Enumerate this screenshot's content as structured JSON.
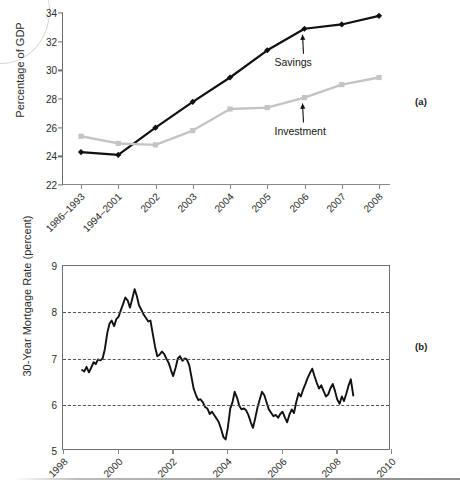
{
  "figure": {
    "panel_a_tag": "(a)",
    "panel_b_tag": "(b)"
  },
  "chart_data": [
    {
      "id": "panel-a",
      "type": "line",
      "title": "",
      "xlabel": "",
      "ylabel": "Percentage of GDP",
      "ylim": [
        22,
        34
      ],
      "yticks": [
        22,
        24,
        26,
        28,
        30,
        32,
        34
      ],
      "grid": false,
      "legend": "annotations",
      "categories": [
        "1986–1993",
        "1994–2001",
        "2002",
        "2003",
        "2004",
        "2005",
        "2006",
        "2007",
        "2008"
      ],
      "annotations": [
        {
          "text": "Savings",
          "points_to": "2006"
        },
        {
          "text": "Investment",
          "points_to": "2006"
        }
      ],
      "series": [
        {
          "name": "Savings",
          "color": "#111111",
          "marker": "diamond",
          "values": [
            24.3,
            24.1,
            26.0,
            27.8,
            29.5,
            31.4,
            32.9,
            33.2,
            33.8
          ]
        },
        {
          "name": "Investment",
          "color": "#c4c4c4",
          "marker": "square",
          "values": [
            25.4,
            24.9,
            24.8,
            25.8,
            27.3,
            27.4,
            28.1,
            29.0,
            29.5
          ]
        }
      ]
    },
    {
      "id": "panel-b",
      "type": "line",
      "title": "",
      "xlabel": "",
      "ylabel": "30-Year Mortgage Rate (percent)",
      "ylim": [
        5,
        9
      ],
      "yticks": [
        5,
        6,
        7,
        8,
        9
      ],
      "xlim": [
        1998,
        2010
      ],
      "xticks": [
        1998,
        2000,
        2002,
        2004,
        2006,
        2008,
        2010
      ],
      "grid": true,
      "gridlines_at": [
        6,
        7,
        8
      ],
      "series": [
        {
          "name": "30-Year Mortgage Rate",
          "color": "#111111",
          "x": [
            1998.7,
            1998.78,
            1998.86,
            1998.95,
            1999.03,
            1999.12,
            1999.2,
            1999.28,
            1999.37,
            1999.45,
            1999.53,
            1999.62,
            1999.7,
            1999.78,
            1999.87,
            1999.95,
            2000.03,
            2000.12,
            2000.2,
            2000.28,
            2000.37,
            2000.45,
            2000.53,
            2000.62,
            2000.7,
            2000.78,
            2000.87,
            2000.95,
            2001.03,
            2001.12,
            2001.2,
            2001.28,
            2001.37,
            2001.45,
            2001.53,
            2001.62,
            2001.7,
            2001.78,
            2001.87,
            2001.95,
            2002.03,
            2002.12,
            2002.2,
            2002.28,
            2002.37,
            2002.45,
            2002.53,
            2002.62,
            2002.7,
            2002.78,
            2002.87,
            2002.95,
            2003.03,
            2003.12,
            2003.2,
            2003.28,
            2003.37,
            2003.45,
            2003.53,
            2003.62,
            2003.7,
            2003.78,
            2003.87,
            2003.95,
            2004.03,
            2004.12,
            2004.2,
            2004.28,
            2004.37,
            2004.45,
            2004.53,
            2004.62,
            2004.7,
            2004.78,
            2004.87,
            2004.95,
            2005.03,
            2005.12,
            2005.2,
            2005.28,
            2005.37,
            2005.45,
            2005.53,
            2005.62,
            2005.7,
            2005.78,
            2005.87,
            2005.95,
            2006.03,
            2006.12,
            2006.2,
            2006.28,
            2006.37,
            2006.45,
            2006.53,
            2006.62,
            2006.7,
            2006.78,
            2006.87,
            2006.95,
            2007.03,
            2007.12,
            2007.2,
            2007.28,
            2007.37,
            2007.45,
            2007.53,
            2007.62,
            2007.7,
            2007.78,
            2007.87,
            2007.95,
            2008.03,
            2008.12,
            2008.2,
            2008.28,
            2008.37,
            2008.45,
            2008.53,
            2008.62
          ],
          "y": [
            6.75,
            6.72,
            6.82,
            6.7,
            6.8,
            6.92,
            6.88,
            6.98,
            6.96,
            7.0,
            7.2,
            7.55,
            7.75,
            7.82,
            7.7,
            7.85,
            7.9,
            8.05,
            8.18,
            8.32,
            8.25,
            8.1,
            8.28,
            8.5,
            8.35,
            8.15,
            8.05,
            7.95,
            7.88,
            7.8,
            7.82,
            7.55,
            7.25,
            7.05,
            7.08,
            7.15,
            7.1,
            7.0,
            6.9,
            6.75,
            6.62,
            6.8,
            7.0,
            7.05,
            6.95,
            7.0,
            6.98,
            6.85,
            6.6,
            6.35,
            6.2,
            6.1,
            6.12,
            6.05,
            5.95,
            5.92,
            5.8,
            5.85,
            5.78,
            5.7,
            5.62,
            5.48,
            5.3,
            5.25,
            5.5,
            5.92,
            6.05,
            6.28,
            6.15,
            5.98,
            5.9,
            5.92,
            5.88,
            5.78,
            5.62,
            5.5,
            5.7,
            5.95,
            6.12,
            6.28,
            6.2,
            6.05,
            5.9,
            5.82,
            5.75,
            5.78,
            5.72,
            5.8,
            5.85,
            5.72,
            5.62,
            5.78,
            5.9,
            5.82,
            6.05,
            6.25,
            6.18,
            6.32,
            6.45,
            6.58,
            6.68,
            6.78,
            6.62,
            6.48,
            6.35,
            6.42,
            6.3,
            6.18,
            6.22,
            6.35,
            6.45,
            6.3,
            6.12,
            6.02,
            6.18,
            6.08,
            6.25,
            6.42,
            6.55,
            6.2
          ]
        }
      ]
    }
  ]
}
